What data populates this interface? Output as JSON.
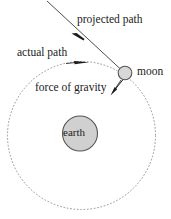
{
  "diagram": {
    "labels": {
      "projected_path": "projected path",
      "actual_path": "actual path",
      "force_of_gravity": "force of gravity",
      "moon": "moon",
      "earth": "earth"
    },
    "bodies": {
      "earth": {
        "name": "earth",
        "center_x": 80,
        "center_y": 133.5,
        "radius": 17.5,
        "fill": "#d0d0d0",
        "stroke": "#555555"
      },
      "moon": {
        "name": "moon",
        "center_x": 125,
        "center_y": 73,
        "radius": 6.8,
        "fill": "#d8d8d8",
        "stroke": "#555555"
      }
    },
    "orbit": {
      "name": "actual path orbit",
      "center_x": 81.5,
      "center_y": 135.5,
      "radius": 74,
      "stroke": "#8a8a8a",
      "dash": "1.6 1.6"
    },
    "arrows": {
      "projected_path": {
        "x1": 47,
        "y1": 1,
        "x2": 122,
        "y2": 70,
        "arrowhead_x": 81,
        "arrowhead_y": 38,
        "stroke": "#333333"
      },
      "orbit_direction": {
        "arrowhead_x": 87,
        "arrowhead_y": 62,
        "stroke": "#1a1a1a"
      },
      "force_of_gravity": {
        "x1": 123,
        "y1": 79,
        "x2": 111,
        "y2": 94,
        "stroke": "#1a1a1a"
      }
    },
    "colors": {
      "background": "#ffffff",
      "ink": "#1a1a1a",
      "body_fill": "#d0d0d0",
      "orbit_line": "#8a8a8a"
    }
  }
}
